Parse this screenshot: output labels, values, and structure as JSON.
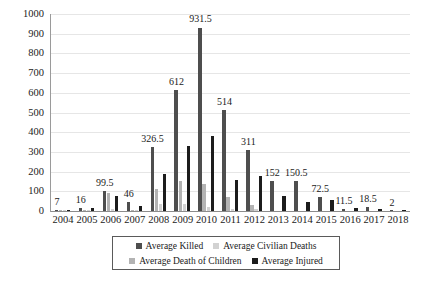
{
  "chart_data": {
    "type": "bar",
    "title": "",
    "subtitle": "",
    "xlabel": "",
    "ylabel": "",
    "ylim": [
      0,
      1000
    ],
    "ytick_step": 100,
    "grid": true,
    "legend_position": "bottom",
    "categories": [
      "2004",
      "2005",
      "2006",
      "2007",
      "2008",
      "2009",
      "2010",
      "2011",
      "2012",
      "2013",
      "2014",
      "2015",
      "2016",
      "2017",
      "2018"
    ],
    "yticks": [
      "0",
      "100",
      "200",
      "300",
      "400",
      "500",
      "600",
      "700",
      "800",
      "900",
      "1000"
    ],
    "series": [
      {
        "name": "Average Killed",
        "color": "#4e4e4e",
        "values": [
          7,
          16,
          99.5,
          46,
          326.5,
          612,
          931.5,
          514,
          311,
          152,
          150.5,
          72.5,
          11.5,
          18.5,
          2
        ]
      },
      {
        "name": "Average Civilian Deaths",
        "color": "#b3b3b3",
        "values": [
          2,
          5,
          90,
          6,
          112,
          152,
          139,
          73,
          31,
          0,
          0,
          0,
          0,
          0,
          0
        ]
      },
      {
        "name": "Average Death of Children",
        "color": "#d2d2d2",
        "values": [
          1,
          2,
          10,
          2,
          37,
          37,
          20,
          11,
          9,
          0,
          0,
          0,
          0,
          0,
          0
        ]
      },
      {
        "name": "Average Injured",
        "color": "#1c1c1c",
        "values": [
          3,
          13,
          75,
          26,
          186,
          331,
          383,
          159,
          178,
          76,
          48,
          57,
          14,
          9,
          1
        ]
      }
    ],
    "data_labels": {
      "series": "Average Killed",
      "values": [
        "7",
        "16",
        "99.5",
        "46",
        "326.5",
        "612",
        "931.5",
        "514",
        "311",
        "152",
        "150.5",
        "72.5",
        "11.5",
        "18.5",
        "2"
      ]
    }
  },
  "legend": {
    "items": [
      {
        "label": "Average Killed",
        "color": "#4e4e4e"
      },
      {
        "label": "Average Civilian Deaths",
        "color": "#d2d2d2"
      },
      {
        "label": "Average Death of Children",
        "color": "#b3b3b3"
      },
      {
        "label": "Average Injured",
        "color": "#1c1c1c"
      }
    ]
  },
  "caption": ""
}
